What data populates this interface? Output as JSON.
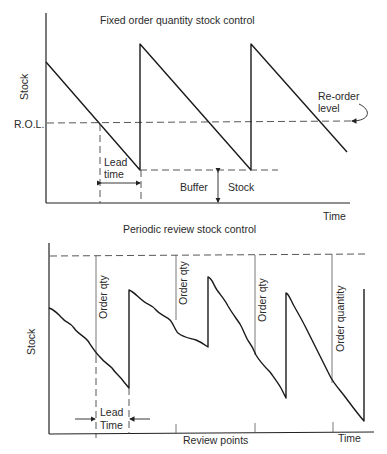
{
  "top_chart": {
    "title": "Fixed order quantity stock control",
    "y_label": "Stock",
    "x_label": "Time",
    "rol_label": "R.O.L.",
    "reorder_level_label": [
      "Re-order",
      "level"
    ],
    "lead_time_label": [
      "Lead",
      "time"
    ],
    "buffer_label": "Buffer",
    "stock_label": "Stock"
  },
  "bottom_chart": {
    "title": "Periodic review stock control",
    "y_label": "Stock",
    "x_label": "Time",
    "review_points_label": "Review points",
    "lead_time_label": [
      "Lead",
      "Time"
    ],
    "order_labels": [
      "Order qty",
      "Order qty",
      "Order qty",
      "Order quantity"
    ]
  },
  "colors": {
    "line": "#1a1a1a",
    "text": "#2a2a2a",
    "background": "#ffffff"
  }
}
